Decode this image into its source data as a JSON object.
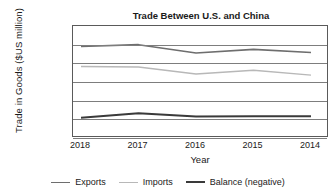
{
  "chart_data": {
    "type": "line",
    "title": "Trade Between U.S. and China",
    "xlabel": "Year",
    "ylabel": "Trade in Goods ($US million)",
    "categories": [
      "2018",
      "2017",
      "2016",
      "2015",
      "2014"
    ],
    "ylim": [
      0,
      600000
    ],
    "ytick_values": [
      0,
      100000,
      200000,
      300000,
      400000,
      500000,
      600000
    ],
    "ytick_labels": [
      "$0",
      "$100,000",
      "$200,000",
      "$300,000",
      "$400,000",
      "$500,000",
      "$600,000"
    ],
    "grid": true,
    "legend_position": "bottom",
    "series": [
      {
        "name": "Exports",
        "color": "#6e6e6e",
        "width": 1.6,
        "values": [
          490000,
          500000,
          455000,
          475000,
          458000
        ]
      },
      {
        "name": "Imports",
        "color": "#b8b8b8",
        "width": 1.4,
        "values": [
          383000,
          380000,
          343000,
          363000,
          337000
        ]
      },
      {
        "name": "Balance (negative)",
        "color": "#3a3a3a",
        "width": 2.0,
        "values": [
          108000,
          132000,
          115000,
          116000,
          117000
        ]
      }
    ]
  }
}
